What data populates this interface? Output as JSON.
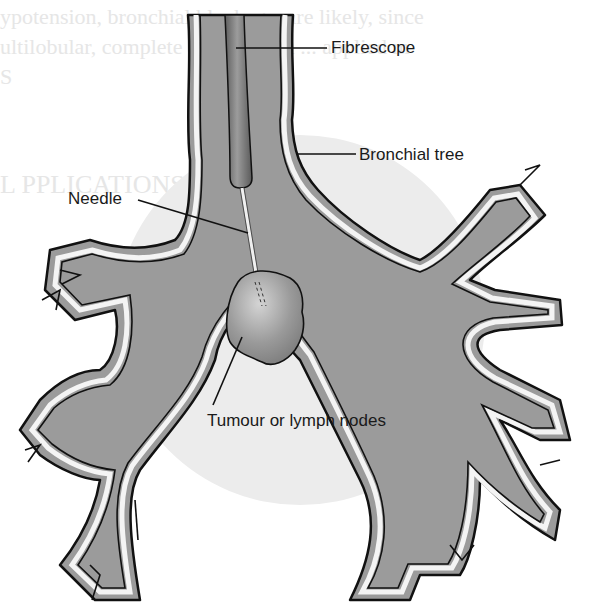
{
  "diagram": {
    "labels": {
      "fibrescope": "Fibrescope",
      "bronchial_tree": "Bronchial tree",
      "needle": "Needle",
      "tumour": "Tumour or lymph nodes"
    },
    "colors": {
      "airway_fill": "#9b9b9b",
      "airway_wall": "#f4f4f4",
      "outline": "#111111",
      "background_circle": "#ececec",
      "tumour": "#8a8a8a",
      "scope": "#7a7a7a",
      "background": "#ffffff"
    }
  },
  "background_bleed_text": [
    "ypotension, bronchial blockage, are likely, since",
    "ultilobular, complete or unilateral ... applied m",
    "S",
    "L   PPLICATIONS"
  ]
}
